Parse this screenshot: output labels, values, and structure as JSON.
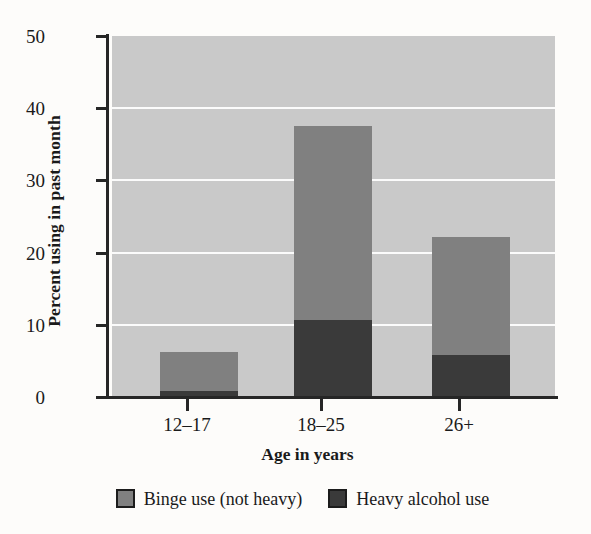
{
  "chart_data": {
    "type": "bar",
    "subtype": "stacked-bar",
    "title": "",
    "xlabel": "Age in years",
    "ylabel": "Percent using in past month",
    "categories": [
      "12–17",
      "18–25",
      "26+"
    ],
    "series": [
      {
        "name": "Binge use (not heavy)",
        "color": "#808080",
        "values": [
          5.3,
          26.8,
          16.4
        ]
      },
      {
        "name": "Heavy alcohol use",
        "color": "#3a3a3a",
        "values": [
          0.9,
          10.7,
          5.8
        ]
      }
    ],
    "stack_totals": [
      6.2,
      37.5,
      22.2
    ],
    "ylim": [
      0,
      50
    ],
    "yticks": [
      0,
      10,
      20,
      30,
      40,
      50
    ],
    "ytick_labels": [
      "0",
      "10",
      "20",
      "30",
      "40",
      "50"
    ],
    "grid": "horizontal-white",
    "plot_background": "#c9c9c9",
    "legend_position": "bottom-center",
    "legend": [
      {
        "label": "Binge use (not heavy)",
        "color": "#808080"
      },
      {
        "label": "Heavy alcohol use",
        "color": "#3a3a3a"
      }
    ]
  }
}
